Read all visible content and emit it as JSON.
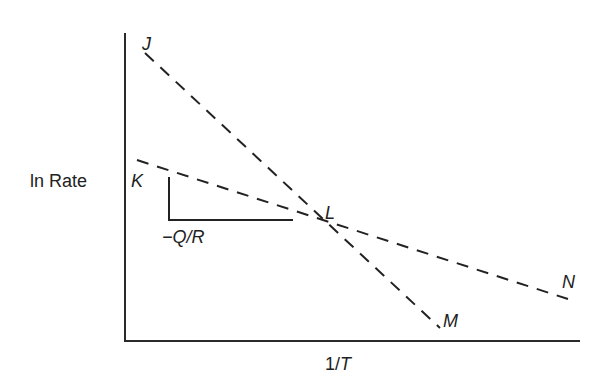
{
  "diagram": {
    "y_axis_label": "ln Rate",
    "x_axis_label_prefix": "1/",
    "x_axis_label_var": "T",
    "slope_label": "−Q/R",
    "points": {
      "J": "J",
      "K": "K",
      "L": "L",
      "M": "M",
      "N": "N"
    },
    "lines": [
      {
        "name": "J-L-M",
        "from": "J",
        "through": "L",
        "to": "M",
        "style": "dashed"
      },
      {
        "name": "K-L-N",
        "from": "K",
        "through": "L",
        "to": "N",
        "style": "dashed"
      }
    ],
    "slope_triangle": {
      "label": "−Q/R",
      "applies_to": "K-L"
    }
  }
}
